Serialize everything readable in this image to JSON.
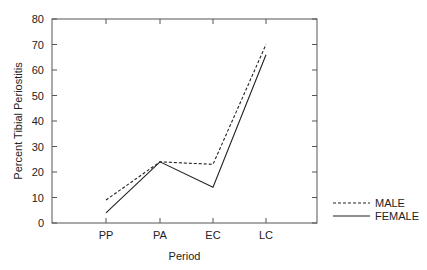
{
  "chart_data": {
    "type": "line",
    "title": "",
    "xlabel": "Period",
    "ylabel": "Percent Tibial Periostitis",
    "categories": [
      "PP",
      "PA",
      "EC",
      "LC"
    ],
    "series": [
      {
        "name": "MALE",
        "style": "dashed",
        "values": [
          9,
          24,
          23,
          70
        ]
      },
      {
        "name": "FEMALE",
        "style": "solid",
        "values": [
          4,
          24,
          14,
          66
        ]
      }
    ],
    "ylim": [
      0,
      80
    ],
    "yticks": [
      0,
      10,
      20,
      30,
      40,
      50,
      60,
      70,
      80
    ],
    "grid": false,
    "legend_position": "lower right, outside plot"
  }
}
